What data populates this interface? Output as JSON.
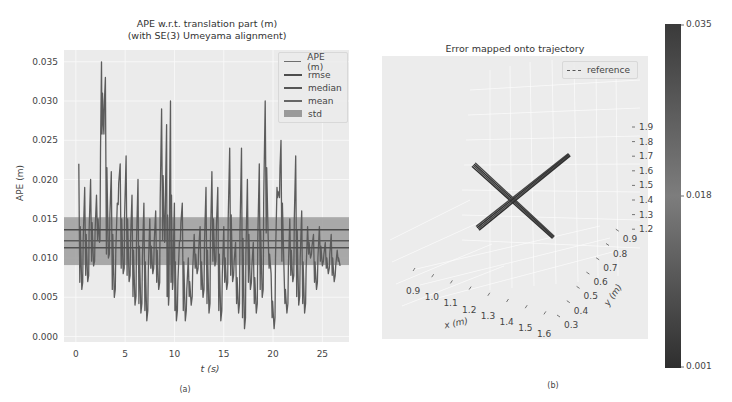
{
  "left_panel": {
    "title_line1": "APE w.r.t. translation part (m)",
    "title_line2": "(with SE(3) Umeyama alignment)",
    "ylabel": "APE (m)",
    "xlabel": "t (s)",
    "caption": "(a)",
    "legend": [
      "APE (m)",
      "rmse",
      "median",
      "mean",
      "std"
    ]
  },
  "right_panel": {
    "title": "Error mapped onto trajectory",
    "legend": "reference",
    "caption": "(b)",
    "xlabel": "x (m)",
    "ylabel": "y (m)",
    "colorbar": {
      "max": "0.035",
      "mid": "0.018",
      "min": "0.001"
    }
  },
  "chart_data": [
    {
      "type": "line",
      "title": "APE w.r.t. translation part (m) (with SE(3) Umeyama alignment)",
      "xlabel": "t (s)",
      "ylabel": "APE (m)",
      "xlim": [
        -1.2,
        27.7
      ],
      "ylim": [
        -0.0007,
        0.0365
      ],
      "xticks": [
        0,
        5,
        10,
        15,
        20,
        25
      ],
      "yticks": [
        0.0,
        0.005,
        0.01,
        0.015,
        0.02,
        0.025,
        0.03,
        0.035
      ],
      "ytick_labels": [
        "0.000",
        "0.005",
        "0.010",
        "0.015",
        "0.020",
        "0.025",
        "0.030",
        "0.035"
      ],
      "grid": true,
      "legend_position": "upper right",
      "statistics": {
        "rmse": 0.0136,
        "median": 0.0113,
        "mean": 0.0122,
        "std_band": [
          0.0091,
          0.0152
        ]
      },
      "series": [
        {
          "name": "APE (m)",
          "x": [
            0.3,
            0.6,
            0.9,
            1.2,
            1.5,
            1.8,
            2.1,
            2.4,
            2.6,
            2.8,
            3.0,
            3.3,
            3.6,
            3.9,
            4.2,
            4.5,
            4.8,
            5.1,
            5.4,
            5.7,
            6.0,
            6.3,
            6.6,
            6.9,
            7.2,
            7.5,
            7.8,
            8.1,
            8.4,
            8.7,
            9.0,
            9.2,
            9.4,
            9.6,
            9.8,
            10.0,
            10.2,
            10.5,
            10.8,
            11.1,
            11.4,
            11.7,
            12.0,
            12.3,
            12.6,
            12.9,
            13.2,
            13.5,
            13.8,
            14.1,
            14.4,
            14.7,
            15.0,
            15.3,
            15.6,
            15.9,
            16.2,
            16.5,
            16.8,
            17.1,
            17.4,
            17.7,
            18.0,
            18.3,
            18.6,
            18.9,
            19.2,
            19.5,
            19.8,
            20.1,
            20.4,
            20.6,
            20.8,
            21.1,
            21.4,
            21.7,
            22.0,
            22.3,
            22.6,
            22.9,
            23.2,
            23.5,
            23.8,
            24.1,
            24.4,
            24.7,
            25.0,
            25.3,
            25.6,
            25.9,
            26.2,
            26.5,
            26.8
          ],
          "values": [
            0.022,
            0.006,
            0.019,
            0.007,
            0.02,
            0.009,
            0.018,
            0.012,
            0.035,
            0.027,
            0.033,
            0.01,
            0.021,
            0.005,
            0.017,
            0.022,
            0.008,
            0.023,
            0.007,
            0.018,
            0.004,
            0.02,
            0.003,
            0.017,
            0.002,
            0.015,
            0.008,
            0.016,
            0.006,
            0.029,
            0.012,
            0.027,
            0.004,
            0.03,
            0.006,
            0.017,
            0.002,
            0.012,
            0.017,
            0.002,
            0.01,
            0.004,
            0.013,
            0.008,
            0.014,
            0.005,
            0.019,
            0.003,
            0.021,
            0.009,
            0.019,
            0.002,
            0.014,
            0.006,
            0.024,
            0.007,
            0.012,
            0.003,
            0.024,
            0.001,
            0.02,
            0.006,
            0.012,
            0.003,
            0.022,
            0.005,
            0.03,
            0.013,
            0.008,
            0.001,
            0.019,
            0.018,
            0.025,
            0.009,
            0.003,
            0.015,
            0.007,
            0.023,
            0.004,
            0.016,
            0.003,
            0.014,
            0.01,
            0.013,
            0.006,
            0.014,
            0.009,
            0.012,
            0.008,
            0.013,
            0.007,
            0.011,
            0.009
          ]
        },
        {
          "name": "rmse",
          "value": 0.0136
        },
        {
          "name": "median",
          "value": 0.0113
        },
        {
          "name": "mean",
          "value": 0.0122
        },
        {
          "name": "std",
          "range": [
            0.0091,
            0.0152
          ]
        }
      ]
    },
    {
      "type": "scatter",
      "title": "Error mapped onto trajectory",
      "xlabel": "x (m)",
      "ylabel": "y (m)",
      "zlabel": "z (m)",
      "xticks": [
        0.9,
        1.0,
        1.1,
        1.2,
        1.3,
        1.4,
        1.5,
        1.6
      ],
      "yticks": [
        0.3,
        0.4,
        0.5,
        0.6,
        0.7,
        0.8,
        0.9
      ],
      "zticks": [
        1.2,
        1.3,
        1.4,
        1.5,
        1.6,
        1.7,
        1.8,
        1.9
      ],
      "legend": [
        "reference"
      ],
      "colorbar": {
        "min": 0.001,
        "mid": 0.018,
        "max": 0.035,
        "label_ticks": [
          "0.001",
          "0.018",
          "0.035"
        ]
      },
      "trajectory_segments": [
        {
          "from": [
            474,
            165
          ],
          "to": [
            553,
            237
          ]
        },
        {
          "from": [
            478,
            228
          ],
          "to": [
            569,
            155
          ]
        }
      ]
    }
  ]
}
